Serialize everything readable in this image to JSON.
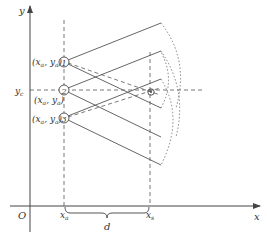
{
  "diagram": {
    "axes": {
      "x_label": "x",
      "y_label": "y",
      "origin_label": "O"
    },
    "ticks": {
      "x_a": "x",
      "x_a_sub": "a",
      "x_s": "x",
      "x_s_sub": "s",
      "y_c": "y",
      "y_c_sub": "c",
      "distance": "d"
    },
    "sensors": [
      {
        "number": "1",
        "coord_label": "(x",
        "sub1": "a",
        "mid": ", y",
        "sub2": "a",
        "close": ")"
      },
      {
        "number": "2",
        "coord_label": "(x",
        "sub1": "a",
        "mid": ", y",
        "sub2": "a",
        "close": ")"
      },
      {
        "number": "3",
        "coord_label": "(x",
        "sub1": "a",
        "mid": ", y",
        "sub2": "a",
        "close": ")"
      }
    ],
    "colors": {
      "line": "#555555",
      "background": "#ffffff"
    }
  }
}
